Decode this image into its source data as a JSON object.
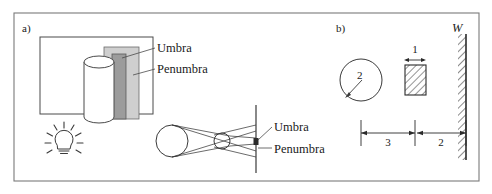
{
  "figure": {
    "background": "#ffffff",
    "frame_color": "#6f6f6f",
    "ink": "#2b2b2b"
  },
  "panel_a": {
    "tag": "a)",
    "labels": {
      "umbra_top": "Umbra",
      "penumbra_top": "Penumbra",
      "umbra_bottom": "Umbra",
      "penumbra_bottom": "Penumbra"
    },
    "icons": {
      "lamp": "light-bulb-icon",
      "cylinder": "cylinder-object-icon",
      "screen": "screen-line-icon"
    },
    "shading": {
      "penumbra_fill": "#cccccc",
      "umbra_fill": "#9a9a9a",
      "screen_fill": "#ffffff"
    }
  },
  "panel_b": {
    "tag": "b)",
    "wall_label": "W",
    "circle_label": "2",
    "block_dimension": "1",
    "distance_source_to_block": "3",
    "distance_block_to_wall": "2",
    "icons": {
      "wall": "hatched-wall-icon",
      "block": "hatched-block-icon",
      "source_circle": "source-circle-icon",
      "radius_arrow": "radius-arrow-icon"
    }
  }
}
